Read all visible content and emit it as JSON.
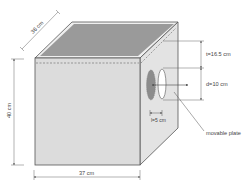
{
  "diagram": {
    "type": "box-with-opening",
    "colors": {
      "front_face": "#dcdcdc",
      "right_face": "#e3e3e3",
      "top_face": "#9a9a9a",
      "top_rim": "#efefef",
      "edge": "#555555",
      "dim_line": "#666666",
      "plate": "#8c8c8c",
      "hole": "#ffffff",
      "text": "#444444"
    },
    "dimensions": {
      "depth": "36 cm",
      "height": "40 cm",
      "width": "37 cm",
      "top_offset": "t=16.5 cm",
      "hole_diameter": "d=10 cm",
      "plate_gap": "l=5 cm"
    },
    "labels": {
      "plate": "movable plate"
    }
  }
}
